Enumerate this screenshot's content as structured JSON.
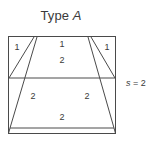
{
  "figure": {
    "title_prefix": "Type ",
    "title_variable": "A",
    "side_label": {
      "variable": "s",
      "equals": " = ",
      "value": "2"
    },
    "stroke_color": "#4a4a4a",
    "text_color": "#3a3a3a",
    "background_color": "#ffffff",
    "region_labels": [
      {
        "name": "left-triangle",
        "text": "1",
        "x": 17,
        "y": 47
      },
      {
        "name": "top-center-upper",
        "text": "1",
        "x": 62,
        "y": 44
      },
      {
        "name": "top-center-lower",
        "text": "2",
        "x": 62,
        "y": 60
      },
      {
        "name": "right-triangle",
        "text": "1",
        "x": 107,
        "y": 47
      },
      {
        "name": "lower-left",
        "text": "2",
        "x": 33,
        "y": 96
      },
      {
        "name": "lower-right",
        "text": "2",
        "x": 87,
        "y": 96
      },
      {
        "name": "lower-center",
        "text": "2",
        "x": 62,
        "y": 117
      }
    ],
    "geometry": {
      "outer_rect": {
        "x": 8,
        "y": 36,
        "width": 108,
        "height": 98
      },
      "divider_y": 78,
      "trapezoid_top_left_x": 37,
      "trapezoid_top_right_x": 88,
      "trapezoid_top_y": 37,
      "trapezoid_bottom_left_x": 10,
      "trapezoid_bottom_right_x": 114,
      "trapezoid_bottom_y": 128
    }
  }
}
